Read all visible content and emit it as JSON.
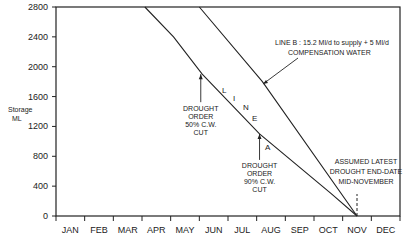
{
  "chart_data": {
    "type": "line",
    "title": "",
    "xlabel": "",
    "ylabel": "Storage ML",
    "ylabel_lines": [
      "Storage",
      "ML"
    ],
    "ylim": [
      0,
      2800
    ],
    "yticks": [
      "0",
      "400",
      "800",
      "1200",
      "1600",
      "2000",
      "2400",
      "2800"
    ],
    "categories": [
      "JAN",
      "FEB",
      "MAR",
      "APR",
      "MAY",
      "JUN",
      "JUL",
      "AUG",
      "SEP",
      "OCT",
      "NOV",
      "DEC"
    ],
    "grid": false,
    "series": [
      {
        "name": "Line A",
        "label_letters": [
          "L",
          "I",
          "N",
          "E",
          "A"
        ],
        "points": [
          {
            "month": 3.1,
            "storage": 2800
          },
          {
            "month": 4.1,
            "storage": 2400
          },
          {
            "month": 5.1,
            "storage": 1900
          },
          {
            "month": 7.1,
            "storage": 1100
          },
          {
            "month": 9.6,
            "storage": 300
          },
          {
            "month": 10.5,
            "storage": 0
          }
        ]
      },
      {
        "name": "Line B",
        "description": "LINE B : 15.2 Ml/d to supply + 5 Ml/d COMPENSATION WATER",
        "points": [
          {
            "month": 5.0,
            "storage": 2800
          },
          {
            "month": 7.2,
            "storage": 1800
          },
          {
            "month": 10.5,
            "storage": 0
          }
        ]
      }
    ],
    "annotations": [
      {
        "text_lines": [
          "LINE B : 15.2 Ml/d to supply + 5 Ml/d",
          "COMPENSATION WATER"
        ],
        "target": "Line B"
      },
      {
        "text_lines": [
          "DROUGHT",
          "ORDER",
          "50% C.W.",
          "CUT"
        ],
        "target": "Line A",
        "at_storage": 1900
      },
      {
        "text_lines": [
          "DROUGHT",
          "ORDER",
          "90% C.W.",
          "CUT"
        ],
        "target": "Line A",
        "at_storage": 1100
      },
      {
        "text_lines": [
          "ASSUMED LATEST",
          "DROUGHT END-DATE",
          "MID-NOVEMBER"
        ],
        "target": "x=mid-Nov",
        "style": "dashed vertical"
      }
    ]
  },
  "labels": {
    "ylabel_top": "Storage",
    "ylabel_bottom": "ML",
    "line_b_1": "LINE B : 15.2 Ml/d to supply + 5 Ml/d",
    "line_b_2": "COMPENSATION WATER",
    "do50": [
      "DROUGHT",
      "ORDER",
      "50% C.W.",
      "CUT"
    ],
    "do90": [
      "DROUGHT",
      "ORDER",
      "90% C.W.",
      "CUT"
    ],
    "end": [
      "ASSUMED LATEST",
      "DROUGHT END-DATE",
      "MID-NOVEMBER"
    ],
    "line_a_letters": [
      "L",
      "I",
      "N",
      "E",
      "A"
    ]
  }
}
